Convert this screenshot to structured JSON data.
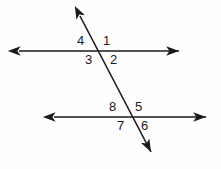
{
  "figure": {
    "name": "parallel-lines-transversal-angles",
    "background_color": "#fefefe",
    "stroke_color": "#1a1a1a",
    "stroke_width": 1.6,
    "canvas": {
      "width": 221,
      "height": 169
    },
    "lines": [
      {
        "name": "top-parallel-line",
        "kind": "double-arrow-line",
        "x1": 17,
        "y1": 51,
        "x2": 181,
        "y2": 51
      },
      {
        "name": "bottom-parallel-line",
        "kind": "double-arrow-line",
        "x1": 52,
        "y1": 117,
        "x2": 208,
        "y2": 117
      },
      {
        "name": "transversal-line",
        "kind": "double-arrow-line",
        "x1": 78,
        "y1": 12,
        "x2": 153,
        "y2": 156
      }
    ],
    "intersections": [
      {
        "name": "upper-intersection",
        "x": 100,
        "y": 51
      },
      {
        "name": "lower-intersection",
        "x": 131,
        "y": 117
      }
    ],
    "angle_labels": [
      {
        "id": "angle-1",
        "text": "1",
        "x": 103,
        "y": 34,
        "position": "upper-right-of-upper-intersection"
      },
      {
        "id": "angle-2",
        "text": "2",
        "x": 110,
        "y": 53,
        "position": "lower-right-of-upper-intersection"
      },
      {
        "id": "angle-3",
        "text": "3",
        "x": 85,
        "y": 53,
        "position": "lower-left-of-upper-intersection"
      },
      {
        "id": "angle-4",
        "text": "4",
        "x": 77,
        "y": 34,
        "position": "upper-left-of-upper-intersection"
      },
      {
        "id": "angle-5",
        "text": "5",
        "x": 135,
        "y": 100,
        "position": "upper-right-of-lower-intersection"
      },
      {
        "id": "angle-6",
        "text": "6",
        "x": 141,
        "y": 119,
        "position": "lower-right-of-lower-intersection"
      },
      {
        "id": "angle-7",
        "text": "7",
        "x": 117,
        "y": 119,
        "position": "lower-left-of-lower-intersection"
      },
      {
        "id": "angle-8",
        "text": "8",
        "x": 109,
        "y": 100,
        "position": "upper-left-of-lower-intersection"
      }
    ]
  }
}
